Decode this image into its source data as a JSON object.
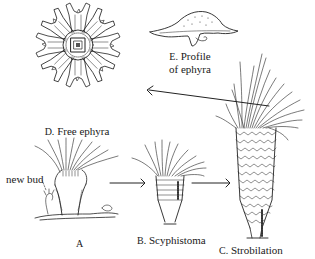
{
  "stages": [
    {
      "letter": "A",
      "name": "",
      "note": "polyp with new bud"
    },
    {
      "letter": "B.",
      "name": "Scyphistoma"
    },
    {
      "letter": "C.",
      "name": "Strobilation"
    },
    {
      "letter": "D.",
      "name": "Free ephyra"
    },
    {
      "letter": "E.",
      "name": "Profile",
      "name_line2": "of ephyra"
    }
  ],
  "annotations": {
    "new_bud": "new bud"
  },
  "arrows": [
    {
      "from": "A",
      "to": "B"
    },
    {
      "from": "B",
      "to": "C"
    },
    {
      "from": "C",
      "to": "D"
    }
  ],
  "colors": {
    "ink": "#1a1a1a",
    "background": "#ffffff"
  }
}
